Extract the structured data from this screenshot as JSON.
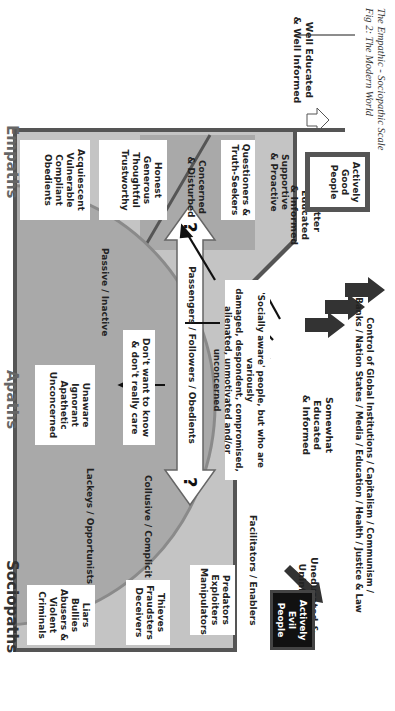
{
  "caption": {
    "line1": "The Empathic - Sociopathic Scale",
    "line2": "Fig 2: The Modern World"
  },
  "education_scale": [
    {
      "label_lines": [
        "Well Educated",
        "& Well Informed"
      ]
    },
    {
      "label_lines": [
        "Better",
        "Educated",
        "& Informed"
      ]
    },
    {
      "label_lines": [
        "Somewhat",
        "Educated",
        "& Informed"
      ]
    },
    {
      "label_lines": [
        "Uneducated &",
        "Uninformed"
      ]
    }
  ],
  "top_banner": {
    "line1": "Control of Global Institutions / Capitalism / Communism /",
    "line2": "Banks / Nation States / Media / Education / Health / Justice & Law"
  },
  "good_side": {
    "actively_good": [
      "Actively",
      "Good",
      "People"
    ],
    "supportive": [
      "Supportive",
      "& Proactive"
    ],
    "questioners": [
      "Questioners &",
      "Truth-Seekers"
    ],
    "concerned": [
      "Concerned",
      "& Disturbed"
    ],
    "honest": [
      "Honest",
      "Generous",
      "Thoughtful",
      "Trustworthy"
    ],
    "acquiescent": [
      "Acquiescent",
      "Vulnerable",
      "Compliant",
      "Obedients"
    ]
  },
  "middle": {
    "socially_aware": [
      "'Socially aware' people, but who are variously",
      "damaged, despondent, compromised,",
      "alienated, unmotivated and/or unconcerned"
    ],
    "passengers_arrow": "Passengers / Followers / Obedients",
    "question_mark": "?",
    "dont_want": [
      "Don't want to know",
      "& don't really care"
    ],
    "unaware": [
      "Unaware",
      "Ignorant",
      "Apathetic",
      "Unconcerned"
    ],
    "passive_label": "Passive / Inactive",
    "lackeys_label": "Lackeys / Opportunists",
    "collusive_label": "Collusive / Complicit",
    "facilitators_label": "Facilitators / Enablers"
  },
  "evil_side": {
    "actively_evil": [
      "Actively",
      "Evil",
      "People"
    ],
    "predators": [
      "Predators",
      "Exploiters",
      "Manipulators"
    ],
    "thieves": [
      "Thieves",
      "Fraudsters",
      "Deceivers"
    ],
    "liars": [
      "Liars",
      "Bullies",
      "Abusers &",
      "Violent",
      "Criminals"
    ]
  },
  "bottom_labels": {
    "empaths": "Empaths",
    "apaths": "Apaths",
    "sociopaths": "Sociopaths"
  },
  "colors": {
    "frame": "#555555",
    "light_fill": "#c4c4c4",
    "mid_fill": "#a9a9a9",
    "dark_fill": "#8f8f8f",
    "evil_box": "#111111",
    "arrow": "#333333"
  }
}
